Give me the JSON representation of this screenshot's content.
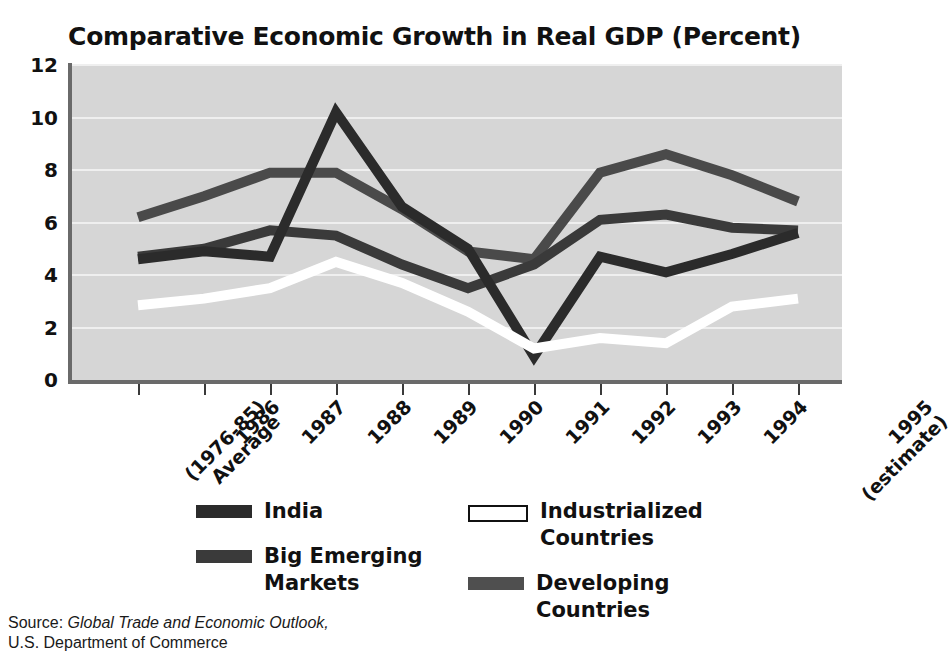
{
  "chart_data": {
    "type": "line",
    "title": "Comparative Economic Growth in Real GDP (Percent)",
    "xlabel": "",
    "ylabel": "",
    "ylim": [
      0,
      12
    ],
    "yticks": [
      0,
      2,
      4,
      6,
      8,
      10,
      12
    ],
    "grid": true,
    "legend_position": "bottom",
    "categories": [
      "(1976-85)\nAverage",
      "1986",
      "1987",
      "1988",
      "1989",
      "1990",
      "1991",
      "1992",
      "1993",
      "1994",
      "1995\n(estimate)"
    ],
    "series": [
      {
        "name": "India",
        "color": "#2b2b2b",
        "values": [
          4.6,
          4.9,
          4.7,
          10.2,
          6.6,
          5.0,
          0.9,
          4.7,
          4.1,
          4.8,
          5.6
        ]
      },
      {
        "name": "Big Emerging Markets",
        "color": "#3a3a3a",
        "values": [
          4.7,
          5.0,
          5.7,
          5.5,
          4.4,
          3.5,
          4.4,
          6.1,
          6.3,
          5.8,
          5.7
        ]
      },
      {
        "name": "Developing Countries",
        "color": "#4a4a4a",
        "values": [
          6.2,
          7.0,
          7.9,
          7.9,
          6.5,
          4.9,
          4.6,
          7.9,
          8.6,
          7.8,
          6.8
        ]
      },
      {
        "name": "Industrialized Countries",
        "color": "#ffffff",
        "values": [
          2.85,
          3.1,
          3.5,
          4.5,
          3.7,
          2.6,
          1.2,
          1.6,
          1.4,
          2.8,
          3.1
        ]
      }
    ]
  },
  "legend": {
    "items": [
      {
        "label": "India",
        "color": "#2b2b2b",
        "outline": false
      },
      {
        "label": "Industrialized\nCountries",
        "color": "#ffffff",
        "outline": true
      },
      {
        "label": "Big Emerging\nMarkets",
        "color": "#3a3a3a",
        "outline": false
      },
      {
        "label": "Developing\nCountries",
        "color": "#4f4f4f",
        "outline": false
      }
    ]
  },
  "source": {
    "prefix": "Source: ",
    "publication": "Global Trade and Economic Outlook,",
    "agency": "U.S. Department of Commerce"
  },
  "style": {
    "plot_background": "#d6d6d6",
    "gridline_color": "#efefef",
    "axis_color": "#6a6a6a",
    "text_color": "#111111"
  }
}
